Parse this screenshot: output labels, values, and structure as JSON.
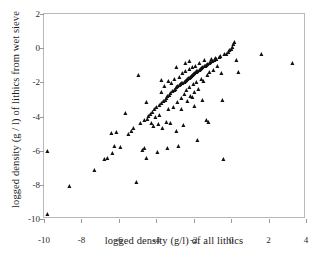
{
  "chart_data": {
    "type": "scatter",
    "title": "",
    "xlabel": "logged density (g/l) of all lithics",
    "ylabel": "logged density (g / l) of lithics from wet sieve",
    "xlim": [
      -10,
      4
    ],
    "ylim": [
      -10,
      2
    ],
    "xticks": [
      -10,
      -8,
      -6,
      -4,
      -2,
      0,
      2,
      4
    ],
    "yticks": [
      -10,
      -8,
      -6,
      -4,
      -2,
      0,
      2
    ],
    "xtick_labels": [
      "-10",
      "-8",
      "-6",
      "-4",
      "-2",
      "0",
      "2",
      "4"
    ],
    "ytick_labels": [
      "-10",
      "-8",
      "-6",
      "-4",
      "-2",
      "0",
      "2"
    ],
    "grid": false,
    "legend": false,
    "marker": "triangle-up",
    "marker_color": "#111111",
    "frame_color": "#b9b9b9",
    "background": "#ffffff",
    "series": [
      {
        "name": "lithic density samples",
        "points": [
          [
            -9.8,
            -9.78
          ],
          [
            -9.78,
            -6.08
          ],
          [
            -8.62,
            -8.1
          ],
          [
            -7.3,
            -7.2
          ],
          [
            -6.72,
            -6.52
          ],
          [
            -6.6,
            -6.48
          ],
          [
            -6.38,
            -5.02
          ],
          [
            -6.3,
            -6.22
          ],
          [
            -6.22,
            -5.78
          ],
          [
            -6.1,
            -4.98
          ],
          [
            -5.9,
            -5.82
          ],
          [
            -5.62,
            -3.85
          ],
          [
            -5.48,
            -5.08
          ],
          [
            -5.3,
            -4.9
          ],
          [
            -5.18,
            -4.72
          ],
          [
            -5.02,
            -7.92
          ],
          [
            -4.92,
            -1.62
          ],
          [
            -4.8,
            -4.42
          ],
          [
            -4.7,
            -6.02
          ],
          [
            -4.62,
            -5.88
          ],
          [
            -4.58,
            -4.28
          ],
          [
            -4.52,
            -3.22
          ],
          [
            -4.48,
            -6.48
          ],
          [
            -4.42,
            -4.18
          ],
          [
            -4.38,
            -4.02
          ],
          [
            -4.3,
            -3.92
          ],
          [
            -4.22,
            -4.42
          ],
          [
            -4.18,
            -3.78
          ],
          [
            -4.12,
            -4.62
          ],
          [
            -4.05,
            -3.62
          ],
          [
            -4.0,
            -4.08
          ],
          [
            -3.95,
            -3.48
          ],
          [
            -3.92,
            -6.12
          ],
          [
            -3.88,
            -4.52
          ],
          [
            -3.82,
            -3.38
          ],
          [
            -3.78,
            -3.95
          ],
          [
            -3.72,
            -2.62
          ],
          [
            -3.68,
            -3.28
          ],
          [
            -3.62,
            -4.72
          ],
          [
            -3.58,
            -3.18
          ],
          [
            -3.55,
            -2.28
          ],
          [
            -3.5,
            -3.08
          ],
          [
            -3.45,
            -4.38
          ],
          [
            -3.42,
            -2.98
          ],
          [
            -3.38,
            -5.88
          ],
          [
            -3.35,
            -2.88
          ],
          [
            -3.3,
            -3.62
          ],
          [
            -3.28,
            -2.78
          ],
          [
            -3.22,
            -4.42
          ],
          [
            -3.2,
            -2.68
          ],
          [
            -3.15,
            -2.08
          ],
          [
            -3.12,
            -2.58
          ],
          [
            -3.08,
            -3.52
          ],
          [
            -3.02,
            -2.48
          ],
          [
            -2.98,
            -1.88
          ],
          [
            -2.95,
            -2.42
          ],
          [
            -2.92,
            -4.92
          ],
          [
            -2.88,
            -2.35
          ],
          [
            -2.85,
            -3.22
          ],
          [
            -2.82,
            -2.28
          ],
          [
            -2.78,
            -5.78
          ],
          [
            -2.75,
            -2.22
          ],
          [
            -2.72,
            -1.72
          ],
          [
            -2.68,
            -2.18
          ],
          [
            -2.65,
            -2.98
          ],
          [
            -2.62,
            -2.12
          ],
          [
            -2.58,
            -1.52
          ],
          [
            -2.55,
            -2.08
          ],
          [
            -2.52,
            -4.58
          ],
          [
            -2.48,
            -2.02
          ],
          [
            -2.45,
            -2.72
          ],
          [
            -2.42,
            -1.98
          ],
          [
            -2.4,
            -1.42
          ],
          [
            -2.38,
            -1.92
          ],
          [
            -2.35,
            -2.52
          ],
          [
            -2.32,
            -1.88
          ],
          [
            -2.28,
            -3.18
          ],
          [
            -2.25,
            -1.82
          ],
          [
            -2.22,
            -1.28
          ],
          [
            -2.2,
            -1.78
          ],
          [
            -2.18,
            -2.32
          ],
          [
            -2.15,
            -1.72
          ],
          [
            -2.12,
            -2.88
          ],
          [
            -2.08,
            -1.68
          ],
          [
            -2.05,
            -1.18
          ],
          [
            -2.02,
            -1.62
          ],
          [
            -2.0,
            -2.18
          ],
          [
            -1.98,
            -1.58
          ],
          [
            -1.95,
            -2.62
          ],
          [
            -1.92,
            -1.52
          ],
          [
            -1.88,
            -1.08
          ],
          [
            -1.85,
            -1.48
          ],
          [
            -1.82,
            -2.02
          ],
          [
            -1.8,
            -1.42
          ],
          [
            -1.78,
            -5.42
          ],
          [
            -1.75,
            -1.38
          ],
          [
            -1.72,
            -2.42
          ],
          [
            -1.68,
            -1.32
          ],
          [
            -1.65,
            -0.92
          ],
          [
            -1.62,
            -1.28
          ],
          [
            -1.58,
            -1.88
          ],
          [
            -1.55,
            -1.22
          ],
          [
            -1.52,
            -3.08
          ],
          [
            -1.48,
            -1.18
          ],
          [
            -1.45,
            -1.98
          ],
          [
            -1.42,
            -1.12
          ],
          [
            -1.38,
            -0.78
          ],
          [
            -1.35,
            -1.08
          ],
          [
            -1.3,
            -4.28
          ],
          [
            -1.28,
            -1.02
          ],
          [
            -1.25,
            -1.62
          ],
          [
            -1.22,
            -0.98
          ],
          [
            -1.18,
            -4.38
          ],
          [
            -1.15,
            -0.92
          ],
          [
            -1.12,
            -1.48
          ],
          [
            -1.08,
            -0.88
          ],
          [
            -1.02,
            -0.72
          ],
          [
            -0.98,
            -0.82
          ],
          [
            -0.92,
            -1.32
          ],
          [
            -0.88,
            -0.78
          ],
          [
            -0.82,
            -0.62
          ],
          [
            -0.78,
            -0.72
          ],
          [
            -0.7,
            -1.08
          ],
          [
            -0.62,
            -0.58
          ],
          [
            -0.52,
            -0.52
          ],
          [
            -0.48,
            -1.52
          ],
          [
            -0.42,
            -3.12
          ],
          [
            -0.38,
            -6.55
          ],
          [
            -0.32,
            -0.42
          ],
          [
            -0.22,
            -0.38
          ],
          [
            -0.12,
            -0.28
          ],
          [
            -0.05,
            -0.18
          ],
          [
            0.02,
            -0.08
          ],
          [
            0.08,
            0.02
          ],
          [
            0.15,
            0.18
          ],
          [
            0.22,
            0.28
          ],
          [
            0.32,
            -0.78
          ],
          [
            0.42,
            -1.48
          ],
          [
            1.65,
            -0.4
          ],
          [
            3.32,
            -0.92
          ],
          [
            -2.88,
            -1.18
          ],
          [
            -2.42,
            -0.92
          ],
          [
            -2.05,
            -2.92
          ],
          [
            -3.3,
            -1.98
          ],
          [
            -2.62,
            -3.62
          ],
          [
            -1.92,
            -3.42
          ],
          [
            -2.18,
            -0.82
          ],
          [
            -3.72,
            -1.92
          ]
        ]
      }
    ]
  }
}
